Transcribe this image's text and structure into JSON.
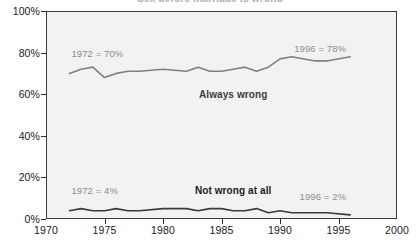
{
  "chart_data": {
    "type": "line",
    "title": "Sex before marriage is wrong",
    "xlabel": "",
    "ylabel": "",
    "xlim": [
      1970,
      2000
    ],
    "ylim": [
      0,
      100
    ],
    "grid": false,
    "legend_position": "inline-labels",
    "x_ticks": [
      "1970",
      "1975",
      "1980",
      "1985",
      "1990",
      "1995",
      "2000"
    ],
    "y_ticks": [
      "0%",
      "20%",
      "40%",
      "60%",
      "80%",
      "100%"
    ],
    "series": [
      {
        "name": "Always wrong",
        "color": "#808080",
        "x": [
          1972,
          1973,
          1974,
          1975,
          1976,
          1977,
          1978,
          1980,
          1982,
          1983,
          1984,
          1985,
          1986,
          1987,
          1988,
          1989,
          1990,
          1991,
          1993,
          1994,
          1996
        ],
        "values": [
          70,
          72,
          73,
          68,
          70,
          71,
          71,
          72,
          71,
          73,
          71,
          71,
          72,
          73,
          71,
          73,
          77,
          78,
          76,
          76,
          78
        ]
      },
      {
        "name": "Not wrong at all",
        "color": "#3a3a3a",
        "x": [
          1972,
          1973,
          1974,
          1975,
          1976,
          1977,
          1978,
          1980,
          1982,
          1983,
          1984,
          1985,
          1986,
          1987,
          1988,
          1989,
          1990,
          1991,
          1993,
          1994,
          1996
        ],
        "values": [
          4,
          5,
          4,
          4,
          5,
          4,
          4,
          5,
          5,
          4,
          5,
          5,
          4,
          4,
          5,
          3,
          4,
          3,
          3,
          3,
          2
        ]
      }
    ],
    "annotations": [
      {
        "text": "1972 = 70%",
        "x": 1972,
        "y": 80
      },
      {
        "text": "1996 = 78%",
        "x": 1996,
        "y": 82
      },
      {
        "text": "1972 = 4%",
        "x": 1972,
        "y": 14
      },
      {
        "text": "1996 = 2%",
        "x": 1996,
        "y": 11
      }
    ],
    "inline_series_labels": [
      {
        "text": "Always wrong",
        "x": 1986,
        "y": 60
      },
      {
        "text": "Not wrong at all",
        "x": 1986,
        "y": 14
      }
    ]
  },
  "axes": {
    "y": {
      "labels": [
        "100%",
        "80%",
        "60%",
        "40%",
        "20%",
        "0%"
      ],
      "values": [
        100,
        80,
        60,
        40,
        20,
        0
      ]
    },
    "x": {
      "labels": [
        "1970",
        "1975",
        "1980",
        "1985",
        "1990",
        "1995",
        "2000"
      ],
      "values": [
        1970,
        1975,
        1980,
        1985,
        1990,
        1995,
        2000
      ]
    }
  },
  "annotations": {
    "left_top": "1972 = 70%",
    "right_top": "1996 = 78%",
    "left_bottom": "1972 = 4%",
    "right_bottom": "1996 = 2%",
    "series_high": "Always wrong",
    "series_low": "Not wrong at all"
  },
  "colors": {
    "plot_background": "#f2f2f2",
    "plot_border": "#3a3a3a",
    "series_high": "#808080",
    "series_low": "#3a3a3a",
    "annotation_text": "#8d8d8d",
    "axis_text": "#1a1a1a"
  }
}
